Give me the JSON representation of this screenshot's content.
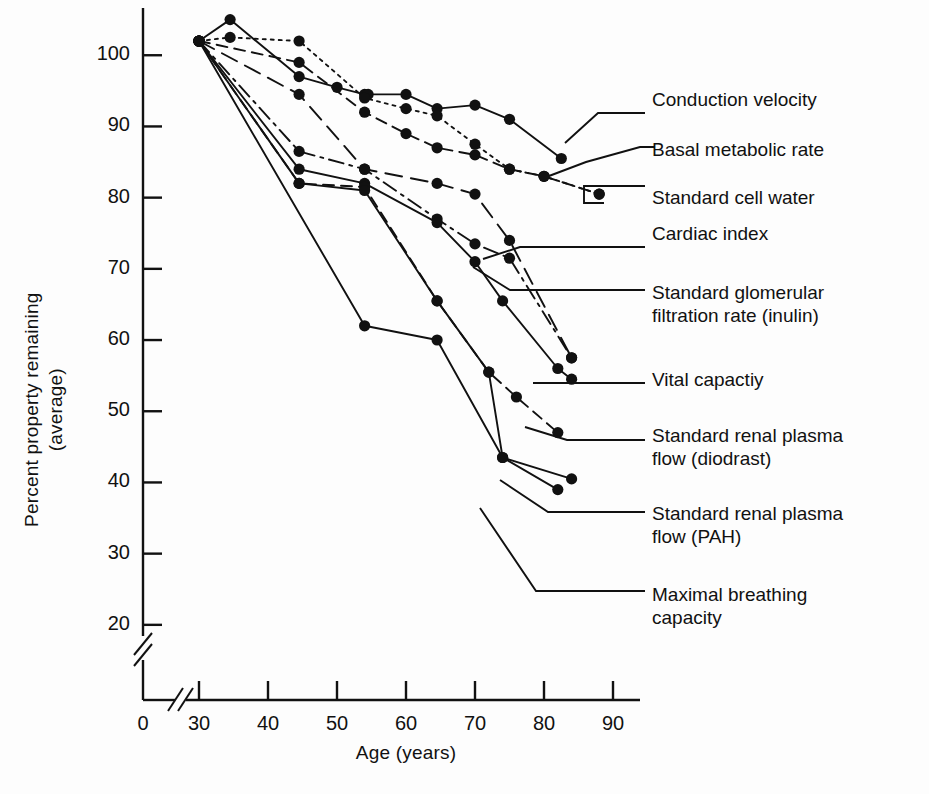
{
  "chart_data": {
    "type": "line",
    "title": "",
    "xlabel": "Age (years)",
    "ylabel": "Percent property remaining\n(average)",
    "xlim": [
      28,
      92
    ],
    "ylim": [
      18,
      108
    ],
    "xticks": [
      30,
      40,
      50,
      60,
      70,
      80,
      90
    ],
    "yticks": [
      20,
      30,
      40,
      50,
      60,
      70,
      80,
      90,
      100
    ],
    "grid": false,
    "legend_position": "right-callouts",
    "axis_break_x": true,
    "axis_break_y": true,
    "series": [
      {
        "name": "Conduction velocity",
        "style": "solid",
        "x": [
          30,
          34.5,
          44.5,
          50,
          54,
          54.5,
          60,
          64.5,
          70,
          75,
          82.5
        ],
        "y": [
          102,
          105,
          97,
          95.5,
          94.5,
          94.5,
          94.5,
          92.5,
          93,
          91,
          85.5
        ]
      },
      {
        "name": "Basal metabolic rate",
        "style": "dotted",
        "x": [
          30,
          34.5,
          44.5,
          54,
          60,
          64.5,
          70,
          75,
          80,
          88
        ],
        "y": [
          102,
          102.5,
          102,
          94,
          92.5,
          91.5,
          87.5,
          84,
          83,
          80.5
        ]
      },
      {
        "name": "Standard cell water",
        "style": "dashed",
        "x": [
          30,
          44.5,
          54,
          60,
          64.5,
          70,
          75,
          80,
          88
        ],
        "y": [
          102,
          99,
          92,
          89,
          87,
          86,
          84,
          83,
          80.5
        ]
      },
      {
        "name": "Cardiac index",
        "style": "dashed-long",
        "x": [
          30,
          44.5,
          54,
          64.5,
          70,
          75,
          84
        ],
        "y": [
          102,
          94.5,
          84,
          82,
          80.5,
          74,
          57.5
        ]
      },
      {
        "name": "Standard glomerular filtration rate (inulin)",
        "style": "dash-dot",
        "x": [
          30,
          44.5,
          54,
          64.5,
          70,
          75,
          84
        ],
        "y": [
          102,
          86.5,
          84,
          77,
          73.5,
          71.5,
          57.5
        ]
      },
      {
        "name": "Vital capactiy",
        "style": "solid",
        "x": [
          30,
          44.5,
          54,
          64.5,
          70,
          74,
          82,
          84
        ],
        "y": [
          102,
          84,
          82,
          76.5,
          71,
          65.5,
          56,
          54.5
        ]
      },
      {
        "name": "Standard renal plasma flow (diodrast)",
        "style": "dashed",
        "x": [
          30,
          44.5,
          54,
          64.5,
          72,
          76,
          82
        ],
        "y": [
          102,
          82,
          81.5,
          65.5,
          55.5,
          52,
          47
        ]
      },
      {
        "name": "Standard renal plasma flow (PAH)",
        "style": "solid",
        "x": [
          30,
          44.5,
          54,
          64.5,
          72,
          74,
          84
        ],
        "y": [
          102,
          82,
          81,
          65.5,
          55.5,
          43.5,
          40.5
        ]
      },
      {
        "name": "Maximal breathing capacity",
        "style": "solid",
        "x": [
          30,
          54,
          64.5,
          74,
          82
        ],
        "y": [
          102,
          62,
          60,
          43.5,
          39
        ]
      }
    ]
  },
  "axes": {
    "y_label_line1": "Percent property remaining",
    "y_label_line2": "(average)",
    "x_label": "Age (years)",
    "y_tick_labels": [
      "100",
      "90",
      "80",
      "70",
      "60",
      "50",
      "40",
      "30",
      "20"
    ],
    "x_tick_labels": [
      "0",
      "30",
      "40",
      "50",
      "60",
      "70",
      "80",
      "90"
    ]
  },
  "legend": {
    "items": [
      {
        "label": "Conduction velocity"
      },
      {
        "label": "Basal metabolic rate"
      },
      {
        "label": "Standard cell water"
      },
      {
        "label": "Cardiac index"
      },
      {
        "label": "Standard glomerular\nfiltration rate (inulin)"
      },
      {
        "label": "Vital capactiy"
      },
      {
        "label": "Standard renal plasma\nflow (diodrast)"
      },
      {
        "label": "Standard renal plasma\nflow (PAH)"
      },
      {
        "label": "Maximal breathing\ncapacity"
      }
    ]
  },
  "colors": {
    "ink": "#111111",
    "background": "#fdfdfd"
  }
}
